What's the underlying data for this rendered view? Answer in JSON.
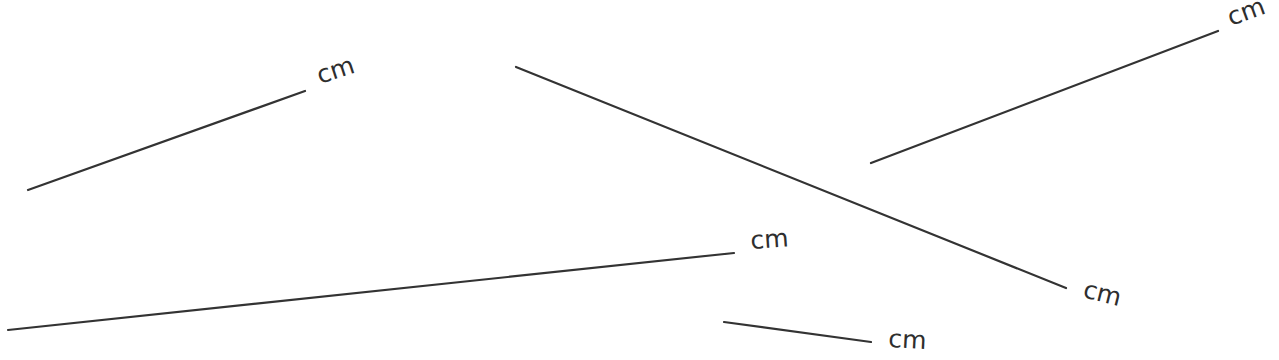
{
  "diagram": {
    "title": "",
    "unit_label": "cm",
    "stroke_color": "#333333",
    "segments": [
      {
        "id": "segment-1",
        "x1": 28,
        "y1": 190,
        "x2": 305,
        "y2": 91,
        "label": "cm",
        "lx": 320,
        "ly": 84,
        "rot": -18
      },
      {
        "id": "segment-2",
        "x1": 516,
        "y1": 67,
        "x2": 1066,
        "y2": 288,
        "label": "cm",
        "lx": 1082,
        "ly": 297,
        "rot": 14
      },
      {
        "id": "segment-3",
        "x1": 871,
        "y1": 163,
        "x2": 1218,
        "y2": 31,
        "label": "cm",
        "lx": 1231,
        "ly": 26,
        "rot": -20
      },
      {
        "id": "segment-4",
        "x1": 8,
        "y1": 330,
        "x2": 734,
        "y2": 253,
        "label": "cm",
        "lx": 751,
        "ly": 249,
        "rot": -4
      },
      {
        "id": "segment-5",
        "x1": 724,
        "y1": 322,
        "x2": 871,
        "y2": 342,
        "label": "cm",
        "lx": 888,
        "ly": 347,
        "rot": 3
      }
    ]
  }
}
